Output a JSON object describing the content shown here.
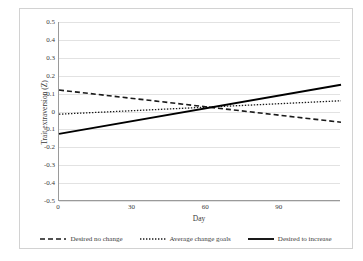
{
  "chart_data": {
    "type": "line",
    "title": "",
    "xlabel": "Day",
    "ylabel": "Trait extraversion (Z)",
    "xlim": [
      0,
      115
    ],
    "ylim": [
      -0.5,
      0.5
    ],
    "grid": true,
    "legend_position": "bottom",
    "x_ticks": [
      {
        "value": 0,
        "label": "0"
      },
      {
        "value": 30,
        "label": "30"
      },
      {
        "value": 60,
        "label": "60"
      },
      {
        "value": 90,
        "label": "90"
      }
    ],
    "y_ticks": [
      {
        "value": 0.5,
        "label": "0.5"
      },
      {
        "value": 0.4,
        "label": "0.4"
      },
      {
        "value": 0.3,
        "label": "0.3"
      },
      {
        "value": 0.2,
        "label": "0.2"
      },
      {
        "value": 0.1,
        "label": "0.1"
      },
      {
        "value": 0,
        "label": "0"
      },
      {
        "value": -0.1,
        "label": "-0.1"
      },
      {
        "value": -0.2,
        "label": "-0.2"
      },
      {
        "value": -0.3,
        "label": "-0.3"
      },
      {
        "value": -0.4,
        "label": "-0.4"
      },
      {
        "value": -0.5,
        "label": "-0.5"
      }
    ],
    "series": [
      {
        "name": "Desired no change",
        "style": "dashed",
        "color": "#1a1a1a",
        "x": [
          0,
          115
        ],
        "values": [
          0.12,
          -0.06
        ]
      },
      {
        "name": "Average change goals",
        "style": "dotted",
        "color": "#1a1a1a",
        "x": [
          0,
          115
        ],
        "values": [
          -0.015,
          0.06
        ]
      },
      {
        "name": "Desired to increase",
        "style": "solid",
        "color": "#000000",
        "x": [
          0,
          115
        ],
        "values": [
          -0.125,
          0.15
        ]
      }
    ]
  },
  "legend": {
    "items": [
      {
        "label": "Desired no change",
        "style": "dashed"
      },
      {
        "label": "Average change goals",
        "style": "dotted"
      },
      {
        "label": "Desired to increase",
        "style": "solid"
      }
    ]
  },
  "colors": {
    "plot_background": "#ffffff",
    "gridline": "#e2e2e2",
    "axis_line": "#9a9a9a",
    "frame": "#d2d2d2",
    "text": "#3b3b3b",
    "series_ink": "#1a1a1a"
  }
}
